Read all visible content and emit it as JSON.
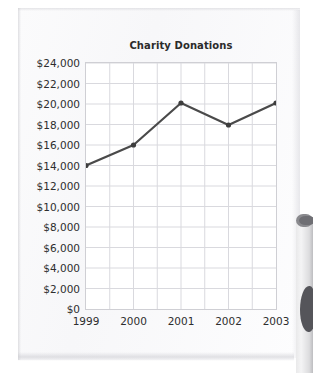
{
  "paper": {
    "background_color": "#f8f8fa"
  },
  "objects": {
    "mug_label": "coffee-mug"
  },
  "chart_data": {
    "type": "line",
    "title": "Charity Donations",
    "xlabel": "",
    "ylabel": "",
    "categories": [
      "1999",
      "2000",
      "2001",
      "2002",
      "2003"
    ],
    "values": [
      14000,
      16000,
      20100,
      17950,
      20100
    ],
    "series": [
      {
        "name": "Charity Donations",
        "values": [
          14000,
          16000,
          20100,
          17950,
          20100
        ]
      }
    ],
    "ylim": [
      0,
      24000
    ],
    "ytick_values": [
      0,
      2000,
      4000,
      6000,
      8000,
      10000,
      12000,
      14000,
      16000,
      18000,
      20000,
      22000,
      24000
    ],
    "ytick_labels": [
      "$24,000",
      "$22,000",
      "$20,000",
      "$18,000",
      "$16,000",
      "$14,000",
      "$12,000",
      "$10,000",
      "$8,000",
      "$6,000",
      "$4,000",
      "$2,000",
      "$0"
    ],
    "xtick_labels": [
      "1999",
      "2000",
      "2001",
      "2002",
      "2003"
    ],
    "grid": true,
    "grid_color": "#d9d9de",
    "legend": false,
    "legend_position": "none",
    "line_color": "#4a4a4a",
    "marker": "circle",
    "marker_color": "#3d3d3d",
    "plot_border_color": "#cfcfd4"
  }
}
